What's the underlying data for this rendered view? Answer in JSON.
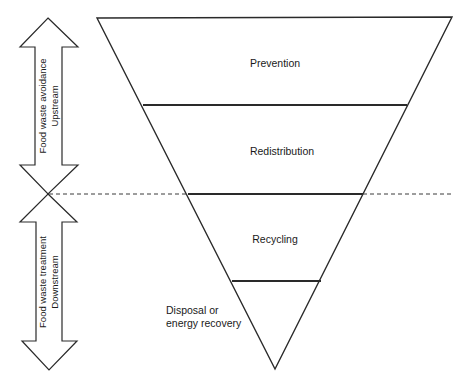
{
  "diagram": {
    "type": "inverted-pyramid hierarchy",
    "tiers": [
      {
        "label": "Prevention"
      },
      {
        "label": "Redistribution"
      },
      {
        "label": "Recycling"
      },
      {
        "label_line1": "Disposal or",
        "label_line2": "energy recovery"
      }
    ],
    "arrows": {
      "upper": {
        "line1": "Food waste avoidance",
        "line2": "Upstream"
      },
      "lower": {
        "line1": "Food waste treatment",
        "line2": "Downstream"
      }
    },
    "colors": {
      "stroke": "#2a2a2a",
      "background": "#ffffff",
      "text": "#1a1a1a"
    }
  }
}
